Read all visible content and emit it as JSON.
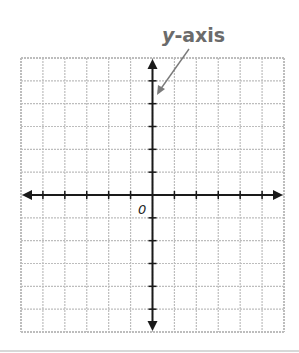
{
  "diagram": {
    "type": "coordinate-plane",
    "callout": {
      "variable": "y",
      "suffix": "-axis"
    },
    "origin_label": "0",
    "grid": {
      "columns": 12,
      "rows": 12,
      "line_color": "#bdbdbd",
      "axis_color": "#1a1a1a"
    },
    "label_color": "#6b6b6b"
  }
}
